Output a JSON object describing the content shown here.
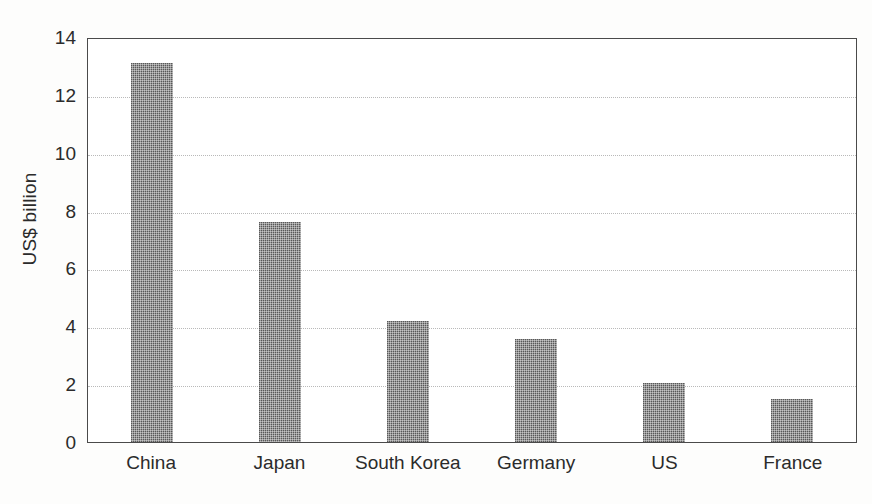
{
  "chart_data": {
    "type": "bar",
    "title": "",
    "xlabel": "",
    "ylabel": "US$ billion",
    "categories": [
      "China",
      "Japan",
      "South Korea",
      "Germany",
      "US",
      "France"
    ],
    "values": [
      13.1,
      7.6,
      4.2,
      3.55,
      2.05,
      1.5
    ],
    "ylim": [
      0,
      14
    ],
    "ytick_values": [
      0,
      2,
      4,
      6,
      8,
      10,
      12,
      14
    ],
    "ytick_labels": [
      "0",
      "2",
      "4",
      "6",
      "8",
      "10",
      "12",
      "14"
    ],
    "grid": true,
    "grid_axis": "y",
    "grid_style": "dotted",
    "legend": false,
    "legend_position": "none",
    "bar_color": "#585858",
    "bar_fill_pattern": "fine-checkered-halftone",
    "axis_color": "#4a4a4a",
    "gridline_color": "#b9b9b9",
    "background_color": "#ffffff"
  }
}
